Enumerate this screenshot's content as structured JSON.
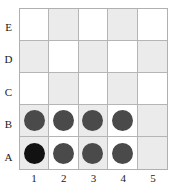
{
  "board": {
    "rows": 5,
    "columns": 5,
    "row_labels": [
      "E",
      "D",
      "C",
      "B",
      "A"
    ],
    "column_labels": [
      "1",
      "2",
      "3",
      "4",
      "5"
    ],
    "colors": {
      "light_square": "#ffffff",
      "dark_square": "#ebebeb",
      "grid_line": "#b5b5b5",
      "border": "#b0b0b0",
      "piece": "#4a4a4a",
      "piece_highlighted": "#121212",
      "label_text": "#1a1a1a"
    },
    "shading_pattern": {
      "E": [
        false,
        true,
        false,
        true,
        false
      ],
      "D": [
        true,
        false,
        true,
        false,
        true
      ],
      "C": [
        false,
        true,
        false,
        true,
        false
      ],
      "B": [
        true,
        false,
        true,
        false,
        true
      ],
      "A": [
        true,
        false,
        true,
        false,
        true
      ]
    },
    "pieces": {
      "E": [
        "",
        "",
        "",
        "",
        ""
      ],
      "D": [
        "",
        "",
        "",
        "",
        ""
      ],
      "C": [
        "",
        "",
        "",
        "",
        ""
      ],
      "B": [
        "normal",
        "normal",
        "normal",
        "normal",
        ""
      ],
      "A": [
        "highlighted",
        "normal",
        "normal",
        "normal",
        ""
      ]
    },
    "occupied_cells": [
      "A1",
      "A2",
      "A3",
      "A4",
      "B1",
      "B2",
      "B3",
      "B4"
    ],
    "highlighted_cell": "A1",
    "piece_count": 8
  }
}
